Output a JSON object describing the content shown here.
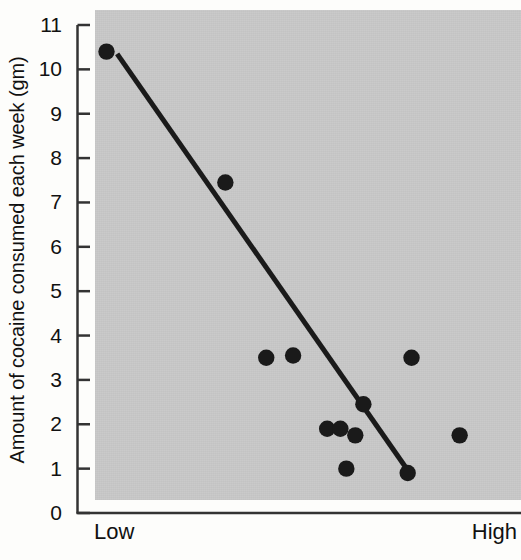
{
  "chart_data": {
    "type": "scatter",
    "title": "",
    "subtitle": "",
    "xlabel": "",
    "ylabel": "Amount of cocaine consumed each week (gm)",
    "x_tick_labels": [
      "Low",
      "High"
    ],
    "y_tick_labels": [
      "0",
      "1",
      "2",
      "3",
      "4",
      "5",
      "6",
      "7",
      "8",
      "9",
      "10",
      "11"
    ],
    "y_ticks": [
      0,
      1,
      2,
      3,
      4,
      5,
      6,
      7,
      8,
      9,
      10,
      11
    ],
    "ylim": [
      0,
      11
    ],
    "xlim": [
      0,
      10
    ],
    "grid": false,
    "legend": null,
    "panel_color": "#c9c9c9",
    "marker_color": "#1a1a1a",
    "line_color": "#1a1a1a",
    "axis_color": "#333333",
    "points": [
      {
        "x": 0.27,
        "y": 10.4
      },
      {
        "x": 3.06,
        "y": 7.45
      },
      {
        "x": 4.02,
        "y": 3.5
      },
      {
        "x": 4.65,
        "y": 3.55
      },
      {
        "x": 5.45,
        "y": 1.9
      },
      {
        "x": 5.76,
        "y": 1.9
      },
      {
        "x": 6.11,
        "y": 1.75
      },
      {
        "x": 6.3,
        "y": 2.45
      },
      {
        "x": 5.9,
        "y": 1.0
      },
      {
        "x": 7.43,
        "y": 3.5
      },
      {
        "x": 7.34,
        "y": 0.9
      },
      {
        "x": 8.56,
        "y": 1.75
      }
    ],
    "trend_line": {
      "type": "linear-fit",
      "start": {
        "x": 0.52,
        "y": 10.35
      },
      "end": {
        "x": 7.46,
        "y": 0.8
      }
    }
  },
  "axes": {
    "y_title": "Amount of cocaine consumed each week (gm)",
    "x_low_label": "Low",
    "x_high_label": "High"
  }
}
